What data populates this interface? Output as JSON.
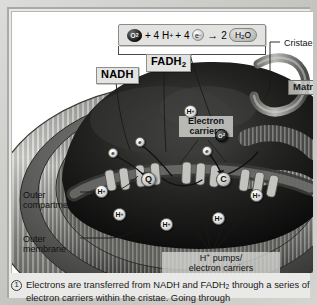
{
  "figure": {
    "equation": {
      "o2": "O2",
      "plus1": "+ 4",
      "h_symbol": "H",
      "h_charge": "+",
      "plus2": "+ 4",
      "e_symbol": "e",
      "e_charge": "−",
      "arrow": "→",
      "coef": "2",
      "water": "H2O"
    },
    "labels": {
      "nadh": "NADH",
      "fadh2_main": "FADH",
      "fadh2_sub": "2",
      "cristae": "Cristae",
      "matrix": "Matrix",
      "electron_carriers_line1": "Electron",
      "electron_carriers_line2": "carriers",
      "outer_compartment_line1": "Outer",
      "outer_compartment_line2": "compartment",
      "outer_membrane_line1": "Outer",
      "outer_membrane_line2": "membrane",
      "h_pumps_line1": "H+ pumps/",
      "h_pumps_line2": "electron carriers"
    },
    "tokens": {
      "proton": "H",
      "proton_charge": "+",
      "electron": "e",
      "oxygen": "O2",
      "carrier_q": "Q",
      "carrier_c": "C"
    },
    "caption": {
      "number": "1",
      "line1": "Electrons are transferred from NADH and FADH2 through",
      "line2": "a series of electron carriers within the cristae. Going through"
    },
    "colors": {
      "frame": "#c9c9c6",
      "panel_background": "#ffffff",
      "matrix_dark": "#1c1c1c",
      "membrane_gray": "#8d8d8a",
      "label_box": "#e4e4e2",
      "text": "#111111"
    }
  }
}
